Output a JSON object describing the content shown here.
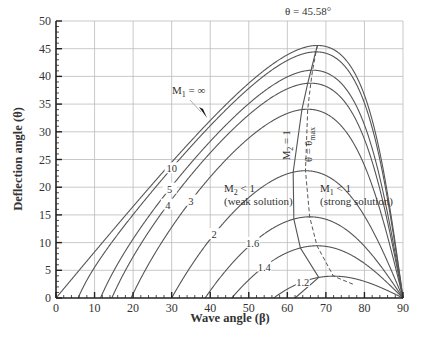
{
  "chart_data": {
    "type": "line",
    "title": "",
    "xlabel": "Wave angle (β)",
    "ylabel": "Deflection angle (θ)",
    "xlim": [
      0,
      90
    ],
    "ylim": [
      0,
      50
    ],
    "xticks": [
      0,
      10,
      20,
      30,
      40,
      50,
      60,
      70,
      80,
      90
    ],
    "yticks": [
      0,
      5,
      10,
      15,
      20,
      25,
      30,
      35,
      40,
      45,
      50
    ],
    "grid": true,
    "legend": "none",
    "gamma": 1.4,
    "series": [
      {
        "name": "M1 = 1.2",
        "mach": 1.2,
        "label": "1.2",
        "label_at_beta": 64,
        "theta_max": 3.94,
        "beta_at_theta_max": 72.0
      },
      {
        "name": "M1 = 1.4",
        "mach": 1.4,
        "label": "1.4",
        "label_at_beta": 54,
        "theta_max": 9.43,
        "beta_at_theta_max": 67.7
      },
      {
        "name": "M1 = 1.6",
        "mach": 1.6,
        "label": "1.6",
        "label_at_beta": 51,
        "theta_max": 14.66,
        "beta_at_theta_max": 66.3
      },
      {
        "name": "M1 = 2",
        "mach": 2.0,
        "label": "2",
        "label_at_beta": 41,
        "theta_max": 22.97,
        "beta_at_theta_max": 64.7
      },
      {
        "name": "M1 = 3",
        "mach": 3.0,
        "label": "3",
        "label_at_beta": 35,
        "theta_max": 34.07,
        "beta_at_theta_max": 65.2
      },
      {
        "name": "M1 = 4",
        "mach": 4.0,
        "label": "4",
        "label_at_beta": 29,
        "theta_max": 38.77,
        "beta_at_theta_max": 65.8
      },
      {
        "name": "M1 = 5",
        "mach": 5.0,
        "label": "5",
        "label_at_beta": 29.5,
        "theta_max": 41.12,
        "beta_at_theta_max": 66.2
      },
      {
        "name": "M1 = 10",
        "mach": 10.0,
        "label": "10",
        "label_at_beta": 30,
        "theta_max": 44.43,
        "beta_at_theta_max": 67.4
      },
      {
        "name": "M1 = ∞",
        "mach": "inf",
        "label": "",
        "theta_max": 45.58,
        "beta_at_theta_max": 67.8
      }
    ],
    "boundary_lines": [
      {
        "name": "M2 = 1 (sonic line)",
        "style": "solid"
      },
      {
        "name": "θ = θmax",
        "style": "dashed"
      }
    ],
    "annotations": [
      {
        "text": "θ = 45.58°",
        "x": 69,
        "y": 47.3
      },
      {
        "text": "M1 = ∞",
        "x": 25,
        "y": 37.5,
        "arrow_to": [
          32,
          33
        ]
      },
      {
        "text": "M2 < 1",
        "x": 41.5,
        "y": 21.5,
        "note": "(weak solution)"
      },
      {
        "text": "M1 < 1",
        "x": 75,
        "y": 21.5,
        "note": "(strong solution)"
      },
      {
        "text": "M2 = 1",
        "x": 62,
        "y": 26,
        "rotated": true
      },
      {
        "text": "θ = θmax",
        "x": 68,
        "y": 26,
        "rotated": true
      }
    ]
  },
  "labels": {
    "xlabel": "Wave angle (β)",
    "ylabel": "Deflection angle (θ)",
    "theta_max_global": "θ = 45.58°",
    "m1_inf_main": "M",
    "m1_inf_sub": "1",
    "m1_inf_rest": " = ∞",
    "weak_main": "M",
    "weak_sub": "2",
    "weak_rest": " < 1",
    "weak_note": "(weak solution)",
    "strong_main": "M",
    "strong_sub": "1",
    "strong_rest": " < 1",
    "strong_note": "(strong solution)",
    "sonic_main": "M",
    "sonic_sub": "2",
    "sonic_rest": " = 1",
    "thetamax_main": "θ = θ",
    "thetamax_sub": "max"
  },
  "colors": {
    "curve": "#555555",
    "grid": "#bbbbbb",
    "axis": "#222222",
    "text": "#333333",
    "background": "#ffffff"
  }
}
